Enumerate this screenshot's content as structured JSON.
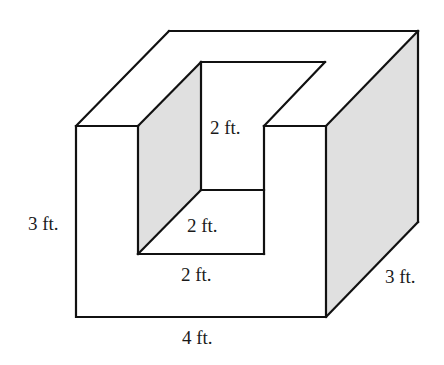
{
  "diagram": {
    "type": "3d-solid-with-notch",
    "colors": {
      "edge": "#111111",
      "shade": "#e0e0e0",
      "background": "#ffffff"
    },
    "labels": {
      "inner_height": "2 ft.",
      "inner_depth": "2 ft.",
      "inner_width": "2 ft.",
      "outer_height": "3 ft.",
      "outer_depth": "3 ft.",
      "outer_width": "4 ft."
    }
  }
}
